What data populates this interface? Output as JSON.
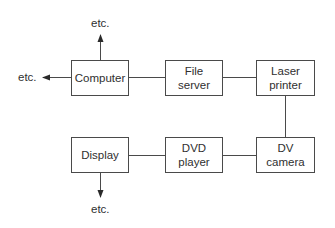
{
  "diagram": {
    "nodes": {
      "computer": {
        "line1": "Computer",
        "line2": ""
      },
      "file_server": {
        "line1": "File",
        "line2": "server"
      },
      "laser_printer": {
        "line1": "Laser",
        "line2": "printer"
      },
      "display": {
        "line1": "Display",
        "line2": ""
      },
      "dvd_player": {
        "line1": "DVD",
        "line2": "player"
      },
      "dv_camera": {
        "line1": "DV",
        "line2": "camera"
      }
    },
    "etc_labels": {
      "top": "etc.",
      "left": "etc.",
      "bottom": "etc."
    },
    "edges": [
      [
        "computer",
        "file_server"
      ],
      [
        "file_server",
        "laser_printer"
      ],
      [
        "laser_printer",
        "dv_camera"
      ],
      [
        "dv_camera",
        "dvd_player"
      ],
      [
        "dvd_player",
        "display"
      ],
      [
        "computer",
        "etc-top"
      ],
      [
        "computer",
        "etc-left"
      ],
      [
        "display",
        "etc-bottom"
      ]
    ]
  }
}
